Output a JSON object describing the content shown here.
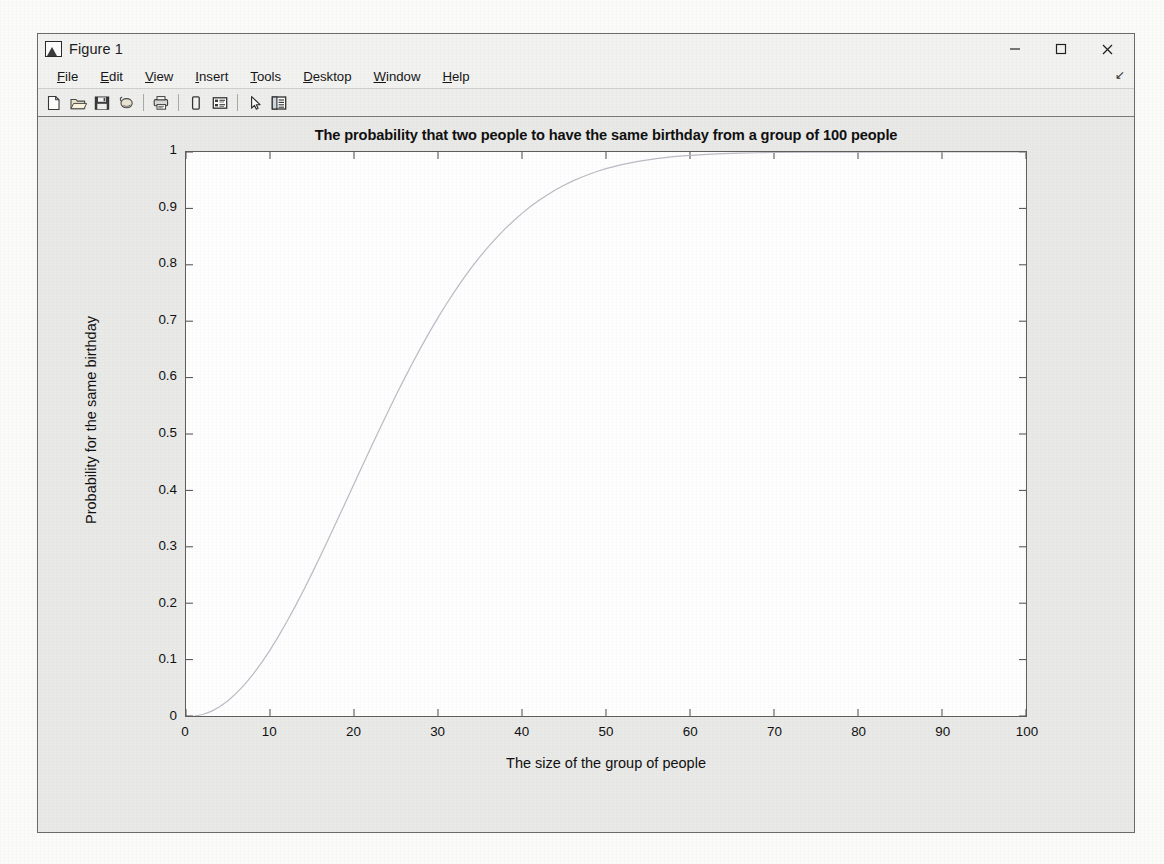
{
  "window": {
    "title": "Figure 1",
    "icon": "matlab-figure-icon",
    "controls": [
      {
        "name": "minimize",
        "glyph": "minimize-icon"
      },
      {
        "name": "maximize",
        "glyph": "maximize-icon"
      },
      {
        "name": "close",
        "glyph": "close-icon"
      }
    ]
  },
  "menubar": {
    "items": [
      {
        "label": "File",
        "mnemonic": "F"
      },
      {
        "label": "Edit",
        "mnemonic": "E"
      },
      {
        "label": "View",
        "mnemonic": "V"
      },
      {
        "label": "Insert",
        "mnemonic": "I"
      },
      {
        "label": "Tools",
        "mnemonic": "T"
      },
      {
        "label": "Desktop",
        "mnemonic": "D"
      },
      {
        "label": "Window",
        "mnemonic": "W"
      },
      {
        "label": "Help",
        "mnemonic": "H"
      }
    ],
    "overflow_glyph": "↘"
  },
  "toolbar": {
    "buttons": [
      {
        "name": "new-figure-icon",
        "tip": "New Figure"
      },
      {
        "name": "open-file-icon",
        "tip": "Open File"
      },
      {
        "name": "save-figure-icon",
        "tip": "Save Figure"
      },
      {
        "name": "print-figure-icon",
        "tip": "Print Figure"
      },
      {
        "name": "print-preview-icon",
        "tip": "Print Preview"
      },
      {
        "name": "insert-colorbar-icon",
        "tip": "Insert Colorbar"
      },
      {
        "name": "insert-legend-icon",
        "tip": "Insert Legend"
      },
      {
        "name": "edit-plot-arrow-icon",
        "tip": "Edit Plot"
      },
      {
        "name": "show-plot-tools-icon",
        "tip": "Show Plot Tools and Dock Figure"
      }
    ]
  },
  "chart_data": {
    "type": "line",
    "title": "The probability that two people to have the same birthday from a group of 100 people",
    "xlabel": "The size of the group of people",
    "ylabel": "Probability for the same birthday",
    "xlim": [
      0,
      100
    ],
    "ylim": [
      0,
      1
    ],
    "xticks": [
      0,
      10,
      20,
      30,
      40,
      50,
      60,
      70,
      80,
      90,
      100
    ],
    "yticks": [
      0,
      0.1,
      0.2,
      0.3,
      0.4,
      0.5,
      0.6,
      0.7,
      0.8,
      0.9,
      1
    ],
    "xtick_labels": [
      "0",
      "10",
      "20",
      "30",
      "40",
      "50",
      "60",
      "70",
      "80",
      "90",
      "100"
    ],
    "ytick_labels": [
      "0",
      "0.1",
      "0.2",
      "0.3",
      "0.4",
      "0.5",
      "0.6",
      "0.7",
      "0.8",
      "0.9",
      "1"
    ],
    "grid": false,
    "legend": null,
    "line_color": "#b9bcc4",
    "line_width": 1.1,
    "series": [
      {
        "name": "P(shared birthday)",
        "x": [
          1,
          2,
          3,
          4,
          5,
          6,
          7,
          8,
          9,
          10,
          11,
          12,
          13,
          14,
          15,
          16,
          17,
          18,
          19,
          20,
          21,
          22,
          23,
          24,
          25,
          26,
          27,
          28,
          29,
          30,
          31,
          32,
          33,
          34,
          35,
          36,
          37,
          38,
          39,
          40,
          41,
          42,
          43,
          44,
          45,
          46,
          47,
          48,
          49,
          50,
          52,
          54,
          56,
          58,
          60,
          62,
          64,
          66,
          68,
          70,
          75,
          80,
          85,
          90,
          95,
          100
        ],
        "y": [
          0,
          0.0027,
          0.0082,
          0.0164,
          0.0271,
          0.0405,
          0.0562,
          0.0743,
          0.0946,
          0.1169,
          0.1411,
          0.167,
          0.1944,
          0.2231,
          0.2529,
          0.2836,
          0.315,
          0.3469,
          0.3791,
          0.4114,
          0.4437,
          0.4757,
          0.5073,
          0.5383,
          0.5687,
          0.5982,
          0.6269,
          0.6545,
          0.681,
          0.7063,
          0.7305,
          0.7533,
          0.775,
          0.7953,
          0.8144,
          0.8322,
          0.8487,
          0.8641,
          0.8782,
          0.8912,
          0.9032,
          0.914,
          0.9239,
          0.9329,
          0.941,
          0.9483,
          0.9548,
          0.9606,
          0.9658,
          0.9704,
          0.978,
          0.9839,
          0.9883,
          0.9917,
          0.9941,
          0.9959,
          0.9971,
          0.998,
          0.9987,
          0.9992,
          0.9997,
          0.9999,
          0.99996,
          0.99999,
          1,
          1
        ]
      }
    ]
  },
  "bleed_text": {
    "lines": [
      "",
      "The inbuilt since                                                                                                            a  in   fact",
      "summarize  a  the  with  the  experiment  in  a  number of  the  same  that  the  group  of  the",
      "the  in  and  in  the  results  of  the  also  are  fewer  that  the  group  considerable  that  the",
      "examine  the  is  a  more  according  to  the  probability  that  two  people  in  a  group  share",
      "birthday  is  the  of  the  a  the  computation  the  simulation  of  the  number",
      "the  approach  in  the  of  a  the  expected  in  the  problem  of  the  group",
      "",
      "Answer",
      "",
      "",
      "",
      "",
      "",
      "",
      ""
    ]
  }
}
